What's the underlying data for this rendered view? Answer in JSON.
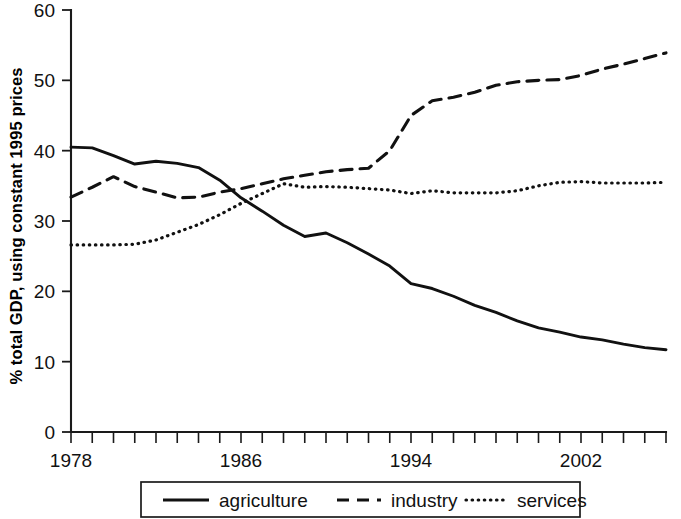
{
  "chart_data": {
    "type": "line",
    "title": "",
    "xlabel": "",
    "ylabel": "% total GDP, using constant 1995 prices",
    "xlim": [
      1978,
      1978
    ],
    "ylim": [
      0,
      60
    ],
    "y_ticks": [
      0,
      10,
      20,
      30,
      40,
      50,
      60
    ],
    "y_tick_labels": [
      "0",
      "10",
      "20",
      "30",
      "40",
      "50",
      "60"
    ],
    "x_ticks_labeled": [
      1978,
      1986,
      1994,
      2002
    ],
    "x_tick_labels": [
      "1978",
      "1986",
      "1994",
      "2002"
    ],
    "x_tick_step": 1,
    "x_start": 1978,
    "x_end": 2006,
    "grid": false,
    "legend_position": "bottom",
    "x": [
      1978,
      1979,
      1980,
      1981,
      1982,
      1983,
      1984,
      1985,
      1986,
      1987,
      1988,
      1989,
      1990,
      1991,
      1992,
      1993,
      1994,
      1995,
      1996,
      1997,
      1998,
      1999,
      2000,
      2001,
      2002,
      2003,
      2004,
      2005,
      2006
    ],
    "series": [
      {
        "name": "agriculture",
        "style": "solid",
        "values": [
          40.5,
          40.4,
          39.3,
          38.1,
          38.5,
          38.2,
          37.6,
          35.8,
          33.3,
          31.4,
          29.4,
          27.8,
          28.3,
          26.9,
          25.3,
          23.6,
          21.1,
          20.4,
          19.3,
          18.0,
          17.0,
          15.8,
          14.8,
          14.2,
          13.5,
          13.1,
          12.5,
          12.0,
          11.7
        ]
      },
      {
        "name": "industry",
        "style": "dashed",
        "values": [
          33.4,
          34.8,
          36.3,
          34.9,
          34.1,
          33.3,
          33.4,
          34.1,
          34.6,
          35.3,
          36.0,
          36.5,
          37.0,
          37.3,
          37.5,
          40.0,
          45.0,
          47.1,
          47.6,
          48.3,
          49.3,
          49.8,
          50.0,
          50.1,
          50.7,
          51.6,
          52.3,
          53.1,
          53.9
        ]
      },
      {
        "name": "services",
        "style": "dotted",
        "values": [
          26.6,
          26.6,
          26.6,
          26.7,
          27.3,
          28.4,
          29.5,
          30.9,
          32.5,
          33.9,
          35.3,
          34.8,
          34.9,
          34.8,
          34.6,
          34.4,
          33.9,
          34.3,
          34.0,
          34.0,
          34.0,
          34.3,
          35.0,
          35.5,
          35.6,
          35.4,
          35.4,
          35.4,
          35.5
        ]
      }
    ]
  },
  "legend": {
    "items": [
      {
        "label": "agriculture",
        "style": "solid"
      },
      {
        "label": "industry",
        "style": "dashed"
      },
      {
        "label": "services",
        "style": "dotted"
      }
    ]
  },
  "axes": {
    "y_title": "% total GDP, using constant 1995 prices"
  }
}
